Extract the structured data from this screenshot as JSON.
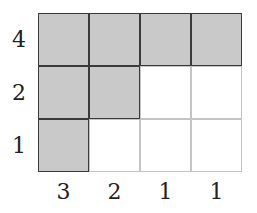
{
  "diagram": {
    "type": "young-diagram",
    "rows": [
      {
        "label": "4",
        "shaded_count": 4
      },
      {
        "label": "2",
        "shaded_count": 2
      },
      {
        "label": "1",
        "shaded_count": 1
      }
    ],
    "column_labels": [
      "3",
      "2",
      "1",
      "1"
    ],
    "columns": 4,
    "colors": {
      "shaded": "#c9c9c9",
      "border_dark": "#3a3a3a",
      "border_light": "#c4c4c4",
      "background": "#ffffff"
    }
  }
}
